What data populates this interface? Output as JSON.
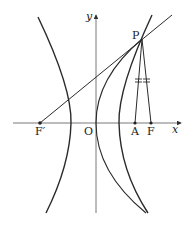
{
  "diagram": {
    "type": "hyperbola-focus-construction",
    "axes": {
      "x_label": "x",
      "y_label": "y",
      "origin_label": "O"
    },
    "points": {
      "P": {
        "label": "P",
        "x": 142,
        "y": 39
      },
      "F_prime": {
        "label": "F′",
        "x": 40,
        "y": 123
      },
      "A": {
        "label": "A",
        "x": 135,
        "y": 123
      },
      "F": {
        "label": "F",
        "x": 151,
        "y": 123
      },
      "O": {
        "label": "O",
        "x": 96,
        "y": 123
      }
    },
    "segments": [
      {
        "from": "F′",
        "to": "P",
        "extended": true
      },
      {
        "from": "P",
        "to": "A",
        "tick_marks": 2
      },
      {
        "from": "P",
        "to": "F",
        "tick_marks": 2
      }
    ],
    "curves": [
      "left hyperbola branch",
      "right hyperbola branch",
      "locus curve through O and P"
    ],
    "colors": {
      "stroke": "#2a2a2a",
      "axis": "#555555"
    }
  }
}
